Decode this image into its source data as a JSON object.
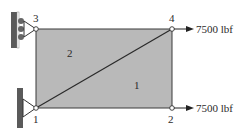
{
  "diagram": {
    "type": "finite-element truss/plate model",
    "nodes": [
      {
        "id": "1",
        "label": "1"
      },
      {
        "id": "2",
        "label": "2"
      },
      {
        "id": "3",
        "label": "3"
      },
      {
        "id": "4",
        "label": "4"
      }
    ],
    "elements": [
      {
        "id": "1",
        "label": "1"
      },
      {
        "id": "2",
        "label": "2"
      }
    ],
    "loads": [
      {
        "node": "4",
        "label": "7500 lbf"
      },
      {
        "node": "2",
        "label": "7500 lbf"
      }
    ],
    "supports": [
      {
        "node": "3",
        "type": "roller"
      },
      {
        "node": "1",
        "type": "pin"
      }
    ],
    "colors": {
      "fill": "#b9b9b9",
      "line": "#3a3a3a",
      "wall": "#5a5a5a"
    }
  }
}
